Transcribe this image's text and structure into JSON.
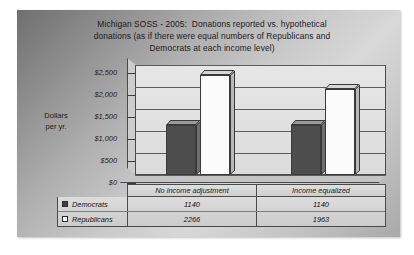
{
  "slide": {
    "background_color": "#b0b0b0",
    "title_lines": [
      "Michigan SOSS - 2005:  Donations reported vs. hypothetical",
      "donations (as if there were equal numbers of Republicans and",
      "Democrats at each income level)"
    ]
  },
  "axis_title_lines": [
    "Dollars",
    "per yr."
  ],
  "chart_data": {
    "type": "bar",
    "title": "Michigan SOSS - 2005:  Donations reported vs. hypothetical donations (as if there were equal numbers of Republicans and Democrats at each income level)",
    "xlabel": "",
    "ylabel": "Dollars per yr.",
    "ylim": [
      0,
      2500
    ],
    "yticks": [
      0,
      500,
      1000,
      1500,
      2000,
      2500
    ],
    "ytick_labels": [
      "$0",
      "$500",
      "$1,000",
      "$1,500",
      "$2,000",
      "$2,500"
    ],
    "grid": true,
    "legend_position": "data-table",
    "categories": [
      "No income adjustment",
      "Income equalized"
    ],
    "series": [
      {
        "name": "Democrats",
        "values": [
          1140,
          1140
        ],
        "color": "#4d4d4d",
        "swatch": "filled-square"
      },
      {
        "name": "Republicans",
        "values": [
          2266,
          1963
        ],
        "color": "#fbfbfb",
        "swatch": "hollow-square"
      }
    ]
  },
  "data_table": {
    "rows": [
      {
        "label": "Democrats",
        "values": [
          "1140",
          "1140"
        ]
      },
      {
        "label": "Republicans",
        "values": [
          "2266",
          "1963"
        ]
      }
    ]
  }
}
